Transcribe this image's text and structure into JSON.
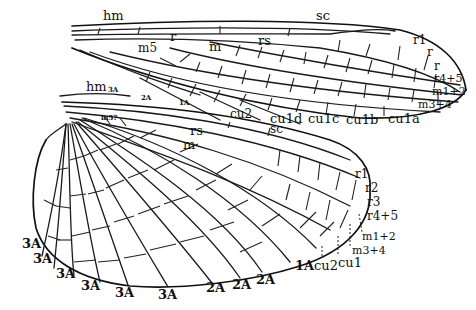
{
  "figure": {
    "forewing": {
      "labels": {
        "hm": "hm",
        "sc": "sc",
        "r": "r",
        "m5": "m5",
        "m": "m",
        "rs": "rs",
        "r1": "r1",
        "r2": "r",
        "r3": "r",
        "r4_5": "r4+5",
        "m1_2": "m1+2",
        "m3_4": "m3+4",
        "cu1d": "cu1d",
        "cu1c": "cu1c",
        "cu1b": "cu1b",
        "cu1a": "cu1a"
      }
    },
    "hindwing": {
      "labels": {
        "hm": "hm",
        "3A_top": "3A",
        "2A_top": "2A",
        "1A_top": "1A",
        "cu2_top": "cu2",
        "sc": "sc",
        "rs": "rs",
        "m": "m",
        "base_small": "m5?",
        "r1": "r1",
        "r2": "r2",
        "r3": "r3",
        "r4_5": "r4+5",
        "m1_2": "m1+2",
        "m3_4": "m3+4",
        "cu1": "cu1",
        "cu2": "cu2",
        "1A": "1A",
        "2A": [
          "2A",
          "2A",
          "2A"
        ],
        "3A": [
          "3A",
          "3A",
          "3A",
          "3A",
          "3A",
          "3A"
        ]
      }
    }
  }
}
